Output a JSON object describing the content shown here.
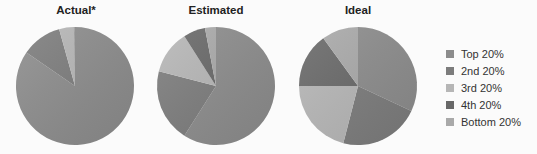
{
  "chart_data": {
    "type": "pie",
    "title": "",
    "legend_position": "right",
    "categories": [
      "Top 20%",
      "2nd 20%",
      "3rd 20%",
      "4th 20%",
      "Bottom 20%"
    ],
    "colors": [
      "#8c8c8c",
      "#7c7c7c",
      "#b6b6b6",
      "#686868",
      "#a9a9a9"
    ],
    "series": [
      {
        "name": "Actual*",
        "values": [
          84,
          11,
          4,
          0.2,
          0.1
        ]
      },
      {
        "name": "Estimated",
        "values": [
          59,
          20,
          12,
          6,
          3
        ]
      },
      {
        "name": "Ideal",
        "values": [
          32,
          22,
          21,
          15,
          10
        ]
      }
    ]
  },
  "titles": [
    "Actual*",
    "Estimated",
    "Ideal"
  ],
  "legend": [
    {
      "label": "Top 20%",
      "color": "#8c8c8c"
    },
    {
      "label": "2nd 20%",
      "color": "#7c7c7c"
    },
    {
      "label": "3rd 20%",
      "color": "#b6b6b6"
    },
    {
      "label": "4th 20%",
      "color": "#686868"
    },
    {
      "label": "Bottom 20%",
      "color": "#a9a9a9"
    }
  ]
}
